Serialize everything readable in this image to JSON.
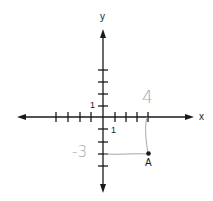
{
  "diagram": {
    "type": "coordinate-plane",
    "axes": {
      "x_label": "x",
      "y_label": "y",
      "x_ticks": [
        -4,
        -3,
        -2,
        -1,
        1,
        2,
        3,
        4
      ],
      "y_ticks": [
        -4,
        -3,
        -2,
        -1,
        1,
        2,
        3,
        4
      ],
      "x_unit_label": "1",
      "y_unit_label": "1"
    },
    "point": {
      "label": "A",
      "x": 4,
      "y": -3
    },
    "annotations": {
      "x_handwritten": "4",
      "y_handwritten": "-3"
    },
    "colors": {
      "axis": "#1a1a1a",
      "annotation": "#a8a8a8",
      "point": "#1a1a1a"
    }
  }
}
